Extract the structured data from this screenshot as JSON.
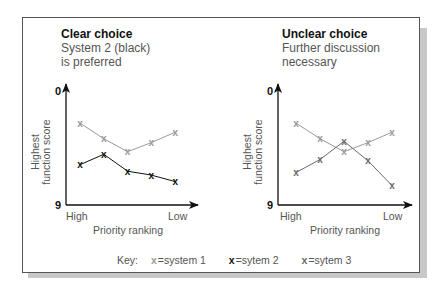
{
  "panels": [
    {
      "title": "Clear choice",
      "subtitle_line1": "System 2 (black)",
      "subtitle_line2": "is preferred"
    },
    {
      "title": "Unclear choice",
      "subtitle_line1": "Further discussion",
      "subtitle_line2": "necessary"
    }
  ],
  "axes": {
    "y_label_line1": "Highest",
    "y_label_line2": "function score",
    "y_top_tick": "0",
    "y_bottom_tick": "9",
    "x_left_label": "High",
    "x_right_label": "Low",
    "x_title": "Priority ranking"
  },
  "key": {
    "label": "Key:",
    "items": [
      {
        "marker": "x",
        "text": "=system 1",
        "color": "#9a9a9a"
      },
      {
        "marker": "x",
        "text": "=sytem 2",
        "color": "#111111"
      },
      {
        "marker": "x",
        "text": "=sytem 3",
        "color": "#6a6a6a"
      }
    ]
  },
  "chart_data": [
    {
      "type": "line",
      "title": "Clear choice",
      "subtitle": "System 2 (black) is preferred",
      "xlabel": "Priority ranking",
      "ylabel": "Highest function score",
      "x": [
        1,
        2,
        3,
        4,
        5
      ],
      "x_tick_labels": {
        "1": "High",
        "5": "Low"
      },
      "ylim": [
        9,
        0
      ],
      "y_inverted": true,
      "grid": false,
      "series": [
        {
          "name": "system 1",
          "color": "#9a9a9a",
          "values": [
            2.7,
            3.9,
            4.9,
            4.2,
            3.4
          ]
        },
        {
          "name": "sytem 2",
          "color": "#111111",
          "values": [
            5.9,
            5.1,
            6.4,
            6.7,
            7.2
          ]
        }
      ]
    },
    {
      "type": "line",
      "title": "Unclear choice",
      "subtitle": "Further discussion necessary",
      "xlabel": "Priority ranking",
      "ylabel": "Highest function score",
      "x": [
        1,
        2,
        3,
        4,
        5
      ],
      "x_tick_labels": {
        "1": "High",
        "5": "Low"
      },
      "ylim": [
        9,
        0
      ],
      "y_inverted": true,
      "grid": false,
      "series": [
        {
          "name": "system 1",
          "color": "#9a9a9a",
          "values": [
            2.7,
            3.9,
            4.9,
            4.2,
            3.4
          ]
        },
        {
          "name": "sytem 3",
          "color": "#6a6a6a",
          "values": [
            6.5,
            5.5,
            4.1,
            5.6,
            7.5
          ]
        }
      ]
    }
  ]
}
